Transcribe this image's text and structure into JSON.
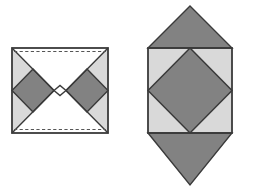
{
  "canvas": {
    "width": 253,
    "height": 191,
    "background": "#ffffff",
    "title": "Two geometric dissection figures"
  },
  "palette": {
    "light_gray": "#d9d9d9",
    "dark_gray": "#828282",
    "white": "#ffffff",
    "stroke": "#3a3a3a",
    "dashed_stroke": "#555555"
  },
  "figures": [
    {
      "id": "left-figure",
      "name": "hourglass-square-figure",
      "label": "Left figure",
      "square": {
        "x1": 12,
        "y1": 48,
        "x2": 108,
        "y2": 133
      },
      "center": {
        "x": 60,
        "y": 90.5
      },
      "notch": {
        "x": 60,
        "y": 90.5,
        "half_width": 6,
        "depth": 5
      },
      "dashed_lines": [
        {
          "name": "top-dashed-line",
          "x1": 14,
          "y1": 51,
          "x2": 106,
          "y2": 51
        },
        {
          "name": "bottom-dashed-line",
          "x1": 14,
          "y1": 130,
          "x2": 106,
          "y2": 130
        }
      ],
      "regions": [
        {
          "name": "left-light-triangle",
          "fill": "light_gray",
          "points": "12,48 54,90.5 12,133"
        },
        {
          "name": "right-light-triangle",
          "fill": "light_gray",
          "points": "108,48 66,90.5 108,133"
        },
        {
          "name": "left-dark-diamond",
          "fill": "dark_gray",
          "points": "33,69 54,90.5 33,112 12,90.5"
        },
        {
          "name": "right-dark-diamond",
          "fill": "dark_gray",
          "points": "87,69 108,90.5 87,112 66,90.5"
        },
        {
          "name": "top-white-triangle",
          "fill": "white",
          "points": "12,48 108,48 66,90.5 60,85.5 54,90.5"
        },
        {
          "name": "bottom-white-triangle",
          "fill": "white",
          "points": "12,133 54,90.5 60,95.5 66,90.5 108,133"
        }
      ],
      "edges": [
        {
          "name": "outer-border",
          "points": "12,48 108,48 108,133 12,133",
          "closed": true
        },
        {
          "name": "diagonal-top-left",
          "x1": 12,
          "y1": 48,
          "x2": 54,
          "y2": 90.5
        },
        {
          "name": "diagonal-bottom-left",
          "x1": 12,
          "y1": 133,
          "x2": 54,
          "y2": 90.5
        },
        {
          "name": "diagonal-top-right",
          "x1": 108,
          "y1": 48,
          "x2": 66,
          "y2": 90.5
        },
        {
          "name": "diagonal-bottom-right",
          "x1": 108,
          "y1": 133,
          "x2": 66,
          "y2": 90.5
        },
        {
          "name": "notch-left",
          "x1": 54,
          "y1": 90.5,
          "x2": 60,
          "y2": 85.5
        },
        {
          "name": "notch-right",
          "x1": 60,
          "y1": 85.5,
          "x2": 66,
          "y2": 90.5
        },
        {
          "name": "notch-left-lower",
          "x1": 54,
          "y1": 90.5,
          "x2": 60,
          "y2": 95.5
        },
        {
          "name": "notch-right-lower",
          "x1": 60,
          "y1": 95.5,
          "x2": 66,
          "y2": 90.5
        },
        {
          "name": "left-diamond-edge",
          "points": "33,69 54,90.5 33,112 12,90.5",
          "closed": true
        },
        {
          "name": "right-diamond-edge",
          "points": "87,69 108,90.5 87,112 66,90.5",
          "closed": true
        }
      ]
    },
    {
      "id": "right-figure",
      "name": "diamond-in-square-figure",
      "label": "Right figure",
      "square": {
        "x1": 148,
        "y1": 48,
        "x2": 232,
        "y2": 133
      },
      "center": {
        "x": 190,
        "y": 90.5
      },
      "top_apex": {
        "x": 190,
        "y": 6
      },
      "bottom_apex": {
        "x": 190,
        "y": 185
      },
      "regions": [
        {
          "name": "square-light-background",
          "fill": "light_gray",
          "points": "148,48 232,48 232,133 148,133"
        },
        {
          "name": "inscribed-dark-diamond",
          "fill": "dark_gray",
          "points": "190,48 232,90.5 190,133 148,90.5"
        },
        {
          "name": "top-dark-triangle",
          "fill": "dark_gray",
          "points": "148,48 190,6 232,48"
        },
        {
          "name": "bottom-dark-triangle",
          "fill": "dark_gray",
          "points": "148,133 190,185 232,133"
        }
      ],
      "edges": [
        {
          "name": "outer-square-border",
          "points": "148,48 232,48 232,133 148,133",
          "closed": true
        },
        {
          "name": "diamond-border",
          "points": "190,48 232,90.5 190,133 148,90.5",
          "closed": true
        },
        {
          "name": "top-triangle-left-edge",
          "x1": 148,
          "y1": 48,
          "x2": 190,
          "y2": 6
        },
        {
          "name": "top-triangle-right-edge",
          "x1": 190,
          "y1": 6,
          "x2": 232,
          "y2": 48
        },
        {
          "name": "bottom-triangle-left-edge",
          "x1": 148,
          "y1": 133,
          "x2": 190,
          "y2": 185
        },
        {
          "name": "bottom-triangle-right-edge",
          "x1": 190,
          "y1": 185,
          "x2": 232,
          "y2": 133
        }
      ]
    }
  ]
}
